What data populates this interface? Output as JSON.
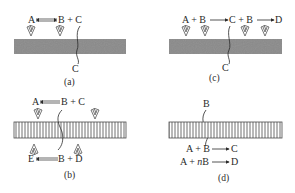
{
  "panels": [
    {
      "id": "a",
      "caption": "(a)",
      "surface": "solid",
      "reaction": {
        "left": "A",
        "arrow": "equilibrium",
        "right": "B + C"
      },
      "diffusing_species": "C"
    },
    {
      "id": "b",
      "caption": "(b)",
      "surface": "striped",
      "reaction_top": {
        "left": "A",
        "arrow": "equilibrium",
        "right": "B + C"
      },
      "reaction_bottom": {
        "left": "E",
        "arrow": "equilibrium",
        "right": "B + D"
      }
    },
    {
      "id": "c",
      "caption": "(c)",
      "surface": "solid",
      "reaction": {
        "part1_left": "A + B",
        "part1_right": "C + B",
        "part2_right": "D"
      },
      "diffusing_species": "C"
    },
    {
      "id": "d",
      "caption": "(d)",
      "surface": "striped",
      "diffusing_species": "B",
      "reactions": [
        {
          "left": "A + B",
          "right": "C"
        },
        {
          "left": "A + ",
          "italic": "n",
          "left_after": "B",
          "right": "D"
        }
      ]
    }
  ],
  "colors": {
    "solid_surface": "#8a8a8a",
    "stripe_line": "#4a4a4a",
    "text": "#2a2a2a"
  },
  "icons": [
    "catalyst-site-icon",
    "equilibrium-arrow-icon",
    "forward-arrow-icon",
    "diffusion-path-icon"
  ]
}
